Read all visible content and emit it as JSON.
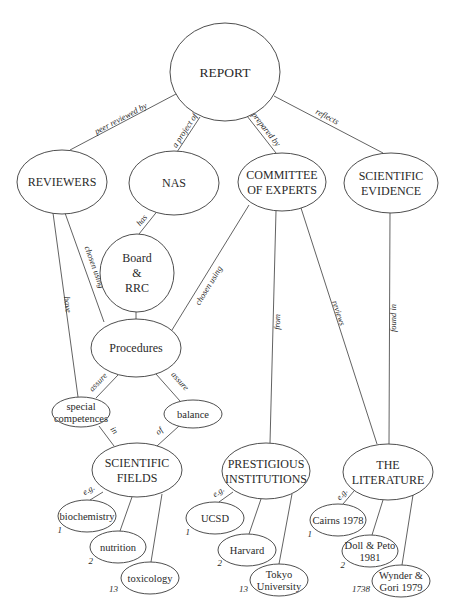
{
  "diagram": {
    "colors": {
      "stroke": "#3a3a3a",
      "text": "#2a2a2a",
      "background": "#ffffff"
    },
    "nodes": [
      {
        "id": "report",
        "lines": [
          "REPORT"
        ],
        "cx": 225,
        "cy": 72,
        "rx": 55,
        "ry": 49,
        "size": "big"
      },
      {
        "id": "reviewers",
        "lines": [
          "REVIEWERS"
        ],
        "cx": 62,
        "cy": 182,
        "rx": 45,
        "ry": 32,
        "size": "mid"
      },
      {
        "id": "nas",
        "lines": [
          "NAS"
        ],
        "cx": 174,
        "cy": 183,
        "rx": 45,
        "ry": 32,
        "size": "mid"
      },
      {
        "id": "committee",
        "lines": [
          "COMMITTEE",
          "OF EXPERTS"
        ],
        "cx": 282,
        "cy": 182,
        "rx": 44,
        "ry": 29,
        "size": "mid"
      },
      {
        "id": "scientific-evidence",
        "lines": [
          "SCIENTIFIC",
          "EVIDENCE"
        ],
        "cx": 391,
        "cy": 183,
        "rx": 47,
        "ry": 30,
        "size": "mid"
      },
      {
        "id": "board-rrc",
        "lines": [
          "Board",
          "&",
          "RRC"
        ],
        "cx": 137,
        "cy": 273,
        "rx": 37,
        "ry": 39,
        "size": "mid"
      },
      {
        "id": "procedures",
        "lines": [
          "Procedures"
        ],
        "cx": 136,
        "cy": 348,
        "rx": 45,
        "ry": 29,
        "size": "mid"
      },
      {
        "id": "special-competences",
        "lines": [
          "special",
          "competences"
        ],
        "cx": 81,
        "cy": 412,
        "rx": 29,
        "ry": 15,
        "size": "small"
      },
      {
        "id": "balance",
        "lines": [
          "balance"
        ],
        "cx": 193,
        "cy": 414,
        "rx": 29,
        "ry": 14,
        "size": "small"
      },
      {
        "id": "scientific-fields",
        "lines": [
          "SCIENTIFIC",
          "FIELDS"
        ],
        "cx": 137,
        "cy": 470,
        "rx": 45,
        "ry": 27,
        "size": "mid"
      },
      {
        "id": "prestigious-institutions",
        "lines": [
          "PRESTIGIOUS",
          "INSTITUTIONS"
        ],
        "cx": 266,
        "cy": 471,
        "rx": 44,
        "ry": 28,
        "size": "mid"
      },
      {
        "id": "the-literature",
        "lines": [
          "THE",
          "LITERATURE"
        ],
        "cx": 388,
        "cy": 472,
        "rx": 45,
        "ry": 28,
        "size": "mid"
      },
      {
        "id": "biochemistry",
        "lines": [
          "biochemistry"
        ],
        "cx": 87,
        "cy": 516,
        "rx": 29,
        "ry": 16,
        "size": "small"
      },
      {
        "id": "nutrition",
        "lines": [
          "nutrition"
        ],
        "cx": 118,
        "cy": 547,
        "rx": 28,
        "ry": 16,
        "size": "small"
      },
      {
        "id": "toxicology",
        "lines": [
          "toxicology"
        ],
        "cx": 150,
        "cy": 578,
        "rx": 29,
        "ry": 16,
        "size": "small"
      },
      {
        "id": "ucsd",
        "lines": [
          "UCSD"
        ],
        "cx": 215,
        "cy": 518,
        "rx": 29,
        "ry": 16,
        "size": "small"
      },
      {
        "id": "harvard",
        "lines": [
          "Harvard"
        ],
        "cx": 247,
        "cy": 550,
        "rx": 29,
        "ry": 16,
        "size": "small"
      },
      {
        "id": "tokyo-university",
        "lines": [
          "Tokyo",
          "University"
        ],
        "cx": 279,
        "cy": 580,
        "rx": 29,
        "ry": 16,
        "size": "small"
      },
      {
        "id": "cairns-1978",
        "lines": [
          "Cairns 1978"
        ],
        "cx": 338,
        "cy": 520,
        "rx": 28,
        "ry": 16,
        "size": "small"
      },
      {
        "id": "doll-peto-1981",
        "lines": [
          "Doll & Peto",
          "1981"
        ],
        "cx": 370,
        "cy": 551,
        "rx": 28,
        "ry": 16,
        "size": "small"
      },
      {
        "id": "wynder-gori-1979",
        "lines": [
          "Wynder &",
          "Gori 1979"
        ],
        "cx": 401,
        "cy": 581,
        "rx": 29,
        "ry": 16,
        "size": "small"
      }
    ],
    "edges": [
      {
        "from": [
          176,
          94
        ],
        "to": [
          70,
          150
        ],
        "label": "peer reviewed by",
        "lx": 122,
        "ly": 121
      },
      {
        "from": [
          200,
          117
        ],
        "to": [
          177,
          152
        ],
        "label": "a project of",
        "lx": 187,
        "ly": 132
      },
      {
        "from": [
          247,
          116
        ],
        "to": [
          276,
          153
        ],
        "label": "prepared by",
        "lx": 264,
        "ly": 131
      },
      {
        "from": [
          274,
          96
        ],
        "to": [
          383,
          153
        ],
        "label": "reflects",
        "lx": 326,
        "ly": 119
      },
      {
        "from": [
          159,
          209
        ],
        "to": [
          139,
          234
        ],
        "label": "has",
        "lx": 144,
        "ly": 222
      },
      {
        "from": [
          53,
          213
        ],
        "to": [
          78,
          397
        ],
        "label": "have",
        "lx": 65,
        "ly": 305
      },
      {
        "from": [
          65,
          213
        ],
        "to": [
          104,
          322
        ],
        "label": "chosen using",
        "lx": 92,
        "ly": 268
      },
      {
        "from": [
          136,
          312
        ],
        "to": [
          136,
          319
        ],
        "label": "sets",
        "lx": 142,
        "ly": 302
      },
      {
        "from": [
          249,
          205
        ],
        "to": [
          172,
          330
        ],
        "label": "chosen using",
        "lx": 211,
        "ly": 287
      },
      {
        "from": [
          276,
          211
        ],
        "to": [
          270,
          443
        ],
        "label": "from",
        "lx": 280,
        "ly": 322
      },
      {
        "from": [
          301,
          208
        ],
        "to": [
          377,
          444
        ],
        "label": "reviews",
        "lx": 336,
        "ly": 314
      },
      {
        "from": [
          390,
          213
        ],
        "to": [
          389,
          444
        ],
        "label": "found in",
        "lx": 396,
        "ly": 318
      },
      {
        "from": [
          118,
          375
        ],
        "to": [
          96,
          398
        ],
        "label": "assure",
        "lx": 100,
        "ly": 384
      },
      {
        "from": [
          156,
          374
        ],
        "to": [
          180,
          401
        ],
        "label": "assure",
        "lx": 178,
        "ly": 383
      },
      {
        "from": [
          99,
          426
        ],
        "to": [
          114,
          446
        ],
        "label": "in",
        "lx": 112,
        "ly": 432
      },
      {
        "from": [
          179,
          426
        ],
        "to": [
          157,
          446
        ],
        "label": "of",
        "lx": 161,
        "ly": 433
      },
      {
        "from": [
          103,
          492
        ],
        "to": [
          90,
          500
        ],
        "label": "e.g.",
        "lx": 90,
        "ly": 492
      },
      {
        "from": [
          132,
          497
        ],
        "to": [
          120,
          531
        ],
        "label": "",
        "lx": 0,
        "ly": 0
      },
      {
        "from": [
          162,
          494
        ],
        "to": [
          151,
          562
        ],
        "label": "",
        "lx": 0,
        "ly": 0
      },
      {
        "from": [
          233,
          492
        ],
        "to": [
          219,
          502
        ],
        "label": "e.g.",
        "lx": 220,
        "ly": 494
      },
      {
        "from": [
          261,
          499
        ],
        "to": [
          249,
          534
        ],
        "label": "",
        "lx": 0,
        "ly": 0
      },
      {
        "from": [
          292,
          494
        ],
        "to": [
          279,
          564
        ],
        "label": "",
        "lx": 0,
        "ly": 0
      },
      {
        "from": [
          354,
          491
        ],
        "to": [
          343,
          504
        ],
        "label": "e.g.",
        "lx": 344,
        "ly": 496
      },
      {
        "from": [
          383,
          500
        ],
        "to": [
          372,
          535
        ],
        "label": "",
        "lx": 0,
        "ly": 0
      },
      {
        "from": [
          413,
          495
        ],
        "to": [
          402,
          565
        ],
        "label": "",
        "lx": 0,
        "ly": 0
      }
    ],
    "ranks": [
      {
        "text": "1",
        "x": 62,
        "y": 533
      },
      {
        "text": "2",
        "x": 93,
        "y": 564
      },
      {
        "text": "13",
        "x": 118,
        "y": 592
      },
      {
        "text": "1",
        "x": 190,
        "y": 535
      },
      {
        "text": "2",
        "x": 222,
        "y": 566
      },
      {
        "text": "13",
        "x": 248,
        "y": 592
      },
      {
        "text": "1",
        "x": 312,
        "y": 537
      },
      {
        "text": "2",
        "x": 345,
        "y": 568
      },
      {
        "text": "1738",
        "x": 370,
        "y": 592
      }
    ]
  }
}
